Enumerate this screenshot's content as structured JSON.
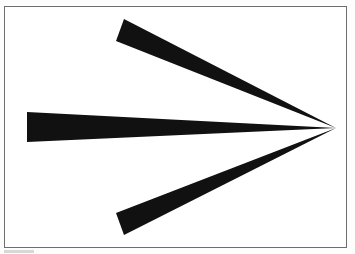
{
  "figure": {
    "fill_color": "#111111",
    "border_color": "#6e6e6e",
    "background_color": "#ffffff",
    "shapes": {
      "upper_barb": "124,19 336,128 116,41",
      "shaft": "27,112 336,128 27,142",
      "lower_barb": "116,213 336,128 124,235"
    },
    "tip": {
      "x": 336,
      "y": 128
    }
  }
}
